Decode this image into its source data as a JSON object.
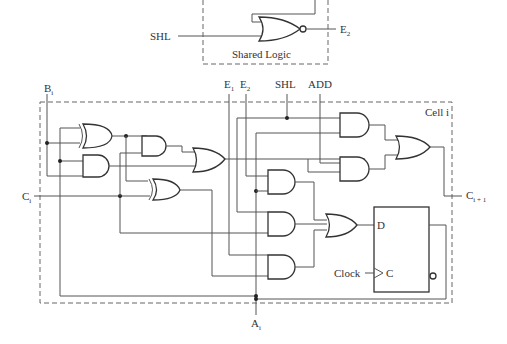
{
  "shared_logic": {
    "title": "Shared Logic",
    "input_label": "SHL",
    "output_label": "E",
    "output_sub": "2"
  },
  "cell": {
    "title": "Cell i",
    "inputs": {
      "B": {
        "label": "B",
        "sub": "i"
      },
      "C": {
        "label": "C",
        "sub": "i"
      },
      "E1": {
        "label": "E",
        "sub": "1"
      },
      "E2": {
        "label": "E",
        "sub": "2"
      },
      "SHL": {
        "label": "SHL"
      },
      "ADD": {
        "label": "ADD"
      },
      "clock": {
        "label": "Clock"
      }
    },
    "outputs": {
      "C_next": {
        "label": "C",
        "sub": "i + 1"
      },
      "A": {
        "label": "A",
        "sub": "i"
      }
    },
    "flipflop": {
      "d_label": "D",
      "c_label": "C"
    }
  }
}
